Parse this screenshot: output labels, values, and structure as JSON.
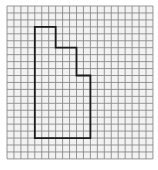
{
  "figure": {
    "type": "grid-polygon",
    "grid": {
      "origin_x": 7,
      "origin_y": 6,
      "cell": 6.95,
      "cols": 21,
      "rows": 22,
      "line_color": "#8a8a8a",
      "background": "#f2f2f2"
    },
    "polygon": {
      "stroke": "#1a1a1a",
      "stroke_width": 1.8,
      "vertices_in_cells": [
        [
          4,
          3
        ],
        [
          7,
          3
        ],
        [
          7,
          6
        ],
        [
          10,
          6
        ],
        [
          10,
          10
        ],
        [
          12,
          10
        ],
        [
          12,
          19
        ],
        [
          4,
          19
        ]
      ]
    }
  }
}
